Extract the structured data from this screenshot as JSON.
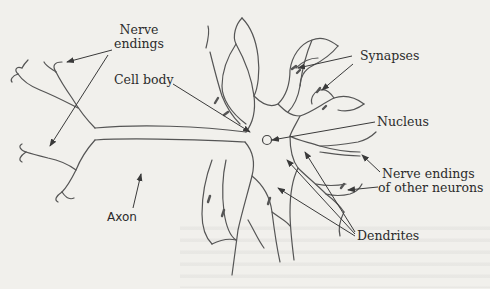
{
  "figure": {
    "colors": {
      "background": "#f1f0ec",
      "ink": "#2b2b2b",
      "line": "#4a4a4a"
    }
  },
  "labels": {
    "nerve_endings": {
      "line1": "Nerve",
      "line2": "endings"
    },
    "cell_body": "Cell body",
    "synapses": "Synapses",
    "nucleus": "Nucleus",
    "nerve_endings_other": {
      "line1": "Nerve endings",
      "line2": "of other neurons"
    },
    "dendrites": "Dendrites",
    "axon": "Axon"
  }
}
